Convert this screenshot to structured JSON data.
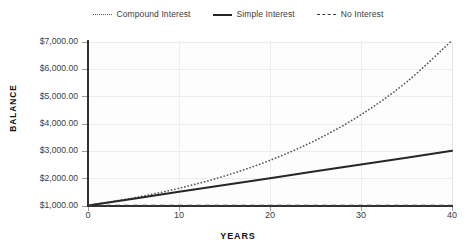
{
  "chart_data": {
    "type": "line",
    "title": "",
    "xlabel": "YEARS",
    "ylabel": "BALANCE",
    "xlim": [
      0,
      40
    ],
    "ylim": [
      1000,
      7000
    ],
    "grid": true,
    "legend_position": "top-center",
    "x": [
      0,
      5,
      10,
      15,
      20,
      25,
      30,
      35,
      40
    ],
    "xticks": [
      "0",
      "10",
      "20",
      "30",
      "40"
    ],
    "xtick_values": [
      0,
      10,
      20,
      30,
      40
    ],
    "yticks": [
      "$1,000.00",
      "$2,000.00",
      "$3,000.00",
      "$4,000.00",
      "$5,000.00",
      "$6,000.00",
      "$7,000.00"
    ],
    "ytick_values": [
      1000,
      2000,
      3000,
      4000,
      5000,
      6000,
      7000
    ],
    "series": [
      {
        "name": "Compound Interest",
        "style": "dotted",
        "color": "#5a5a5a",
        "values": [
          1000,
          1276,
          1629,
          2079,
          2653,
          3386,
          4322,
          5516,
          7040
        ]
      },
      {
        "name": "Simple Interest",
        "style": "solid",
        "color": "#262626",
        "values": [
          1000,
          1250,
          1500,
          1750,
          2000,
          2250,
          2500,
          2750,
          3000
        ]
      },
      {
        "name": "No Interest",
        "style": "dashed",
        "color": "#3a3a3a",
        "values": [
          1000,
          1000,
          1000,
          1000,
          1000,
          1000,
          1000,
          1000,
          1000
        ]
      }
    ]
  },
  "legend": {
    "items": [
      {
        "label": "Compound Interest",
        "marker": "dotted-line-icon"
      },
      {
        "label": "Simple Interest",
        "marker": "solid-line-icon"
      },
      {
        "label": "No Interest",
        "marker": "dashed-line-icon"
      }
    ]
  },
  "axes": {
    "y_title": "BALANCE",
    "x_title": "YEARS"
  }
}
